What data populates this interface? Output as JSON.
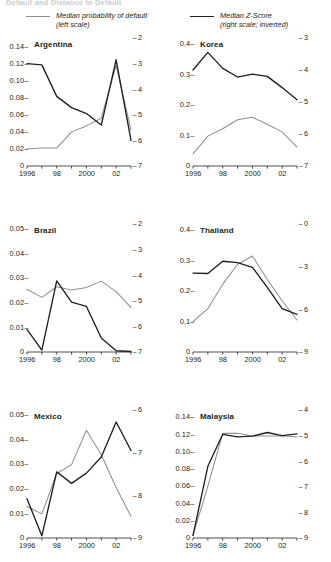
{
  "figure": {
    "title": "Default and Distance to Default",
    "legend": [
      {
        "id": "pd",
        "label_line1": "Median probability of default",
        "label_line2": "(left scale)",
        "color": "#8d9094",
        "style": "grey"
      },
      {
        "id": "z",
        "label_line1": "Median Z-Score",
        "label_line2": "(right scale; inverted)",
        "color": "#231f20",
        "style": "black"
      }
    ]
  },
  "chart_data": {
    "type": "line",
    "title": "Default and Distance to Default",
    "xlabel": "",
    "grid": false,
    "legend_position": "top",
    "x": [
      1996,
      1997,
      1998,
      1999,
      2000,
      2001,
      2002,
      2003
    ],
    "x_ticklabels": [
      "1996",
      "",
      "98",
      "",
      "2000",
      "",
      "02",
      ""
    ],
    "series_names": [
      "Median probability of default",
      "Median Z-Score"
    ],
    "panels": [
      {
        "name": "Argentina",
        "ylabel_left": "",
        "ylim_left": [
          0,
          0.15
        ],
        "yticks_left": [
          "0.14",
          "0.12",
          "0.10",
          "0.08",
          "0.06",
          "0.04",
          "0.02",
          "0"
        ],
        "ytick_values_left": [
          0.14,
          0.12,
          0.1,
          0.08,
          0.06,
          0.04,
          0.02,
          0
        ],
        "ylim_right": [
          2,
          7
        ],
        "yticks_right": [
          "2",
          "3",
          "4",
          "5",
          "6",
          "7"
        ],
        "ytick_values_right": [
          2,
          3,
          4,
          5,
          6,
          7
        ],
        "right_axis_inverted": true,
        "series": [
          {
            "name": "Median probability of default",
            "color": "#8d9094",
            "values": [
              0.02,
              0.021,
              0.021,
              0.04,
              0.047,
              0.056,
              0.118,
              0.042
            ]
          },
          {
            "name": "Median Z-Score",
            "color": "#231f20",
            "values": [
              3.0,
              3.05,
              4.28,
              4.72,
              4.95,
              5.4,
              2.85,
              6.0
            ]
          }
        ]
      },
      {
        "name": "Korea",
        "ylim_left": [
          0,
          0.42
        ],
        "yticks_left": [
          "0.4",
          "0.3",
          "0.2",
          "0.1",
          "0"
        ],
        "ytick_values_left": [
          0.4,
          0.3,
          0.2,
          0.1,
          0
        ],
        "ylim_right": [
          3,
          7
        ],
        "yticks_right": [
          "3",
          "4",
          "5",
          "6",
          "7"
        ],
        "ytick_values_right": [
          3,
          4,
          5,
          6,
          7
        ],
        "right_axis_inverted": true,
        "series": [
          {
            "name": "Median probability of default",
            "color": "#8d9094",
            "values": [
              0.04,
              0.098,
              0.122,
              0.152,
              0.16,
              0.137,
              0.112,
              0.062
            ]
          },
          {
            "name": "Median Z-Score",
            "color": "#231f20",
            "values": [
              4.0,
              3.45,
              3.95,
              4.22,
              4.13,
              4.2,
              4.55,
              4.93
            ]
          }
        ]
      },
      {
        "name": "Brazil",
        "ylim_left": [
          0,
          0.052
        ],
        "yticks_left": [
          "0.05",
          "0.04",
          "0.03",
          "0.02",
          "0.01",
          "0"
        ],
        "ytick_values_left": [
          0.05,
          0.04,
          0.03,
          0.02,
          0.01,
          0
        ],
        "ylim_right": [
          2,
          7
        ],
        "yticks_right": [
          "2",
          "3",
          "4",
          "5",
          "6",
          "7"
        ],
        "ytick_values_right": [
          2,
          3,
          4,
          5,
          6,
          7
        ],
        "right_axis_inverted": true,
        "series": [
          {
            "name": "Median probability of default",
            "color": "#8d9094",
            "values": [
              0.0255,
              0.0222,
              0.0265,
              0.0252,
              0.0262,
              0.0288,
              0.0245,
              0.018
            ]
          },
          {
            "name": "Median Z-Score",
            "color": "#231f20",
            "values": [
              6.12,
              6.93,
              4.22,
              5.05,
              5.22,
              6.45,
              6.95,
              6.98
            ]
          }
        ]
      },
      {
        "name": "Thailand",
        "ylim_left": [
          0,
          0.42
        ],
        "yticks_left": [
          "0.4",
          "0.3",
          "0.2",
          "0.1",
          "0"
        ],
        "ytick_values_left": [
          0.4,
          0.3,
          0.2,
          0.1,
          0
        ],
        "ylim_right": [
          0,
          9
        ],
        "yticks_right": [
          "0",
          "3",
          "6",
          "9"
        ],
        "ytick_values_right": [
          0,
          3,
          6,
          9
        ],
        "right_axis_inverted": true,
        "series": [
          {
            "name": "Median probability of default",
            "color": "#8d9094",
            "values": [
              0.1,
              0.142,
              0.222,
              0.288,
              0.315,
              0.238,
              0.168,
              0.105
            ]
          },
          {
            "name": "Median Z-Score",
            "color": "#231f20",
            "values": [
              3.45,
              3.48,
              2.62,
              2.72,
              3.05,
              4.45,
              5.95,
              6.35
            ]
          }
        ]
      },
      {
        "name": "Mexico",
        "ylim_left": [
          0,
          0.052
        ],
        "yticks_left": [
          "0.05",
          "0.04",
          "0.03",
          "0.02",
          "0.01",
          "0"
        ],
        "ytick_values_left": [
          0.05,
          0.04,
          0.03,
          0.02,
          0.01,
          0
        ],
        "ylim_right": [
          6,
          9
        ],
        "yticks_right": [
          "6",
          "7",
          "8",
          "9"
        ],
        "ytick_values_right": [
          6,
          7,
          8,
          9
        ],
        "right_axis_inverted": true,
        "series": [
          {
            "name": "Median probability of default",
            "color": "#8d9094",
            "values": [
              0.0128,
              0.0098,
              0.0262,
              0.0298,
              0.0438,
              0.0338,
              0.0205,
              0.0088
            ]
          },
          {
            "name": "Median Z-Score",
            "color": "#231f20",
            "values": [
              8.08,
              8.95,
              7.45,
              7.72,
              7.48,
              7.1,
              6.28,
              6.95
            ]
          }
        ]
      },
      {
        "name": "Malaysia",
        "ylim_left": [
          0,
          0.148
        ],
        "yticks_left": [
          "0.14",
          "0.12",
          "0.10",
          "0.08",
          "0.06",
          "0.04",
          "0.02",
          "0"
        ],
        "ytick_values_left": [
          0.14,
          0.12,
          0.1,
          0.08,
          0.06,
          0.04,
          0.02,
          0
        ],
        "ylim_right": [
          4,
          9
        ],
        "yticks_right": [
          "4",
          "5",
          "6",
          "7",
          "8",
          "9"
        ],
        "ytick_values_right": [
          4,
          5,
          6,
          7,
          8,
          9
        ],
        "right_axis_inverted": true,
        "series": [
          {
            "name": "Median probability of default",
            "color": "#8d9094",
            "values": [
              0.003,
              0.06,
              0.121,
              0.121,
              0.118,
              0.118,
              0.118,
              0.117
            ]
          },
          {
            "name": "Median Z-Score",
            "color": "#231f20",
            "values": [
              8.9,
              6.2,
              4.95,
              5.05,
              5.02,
              4.88,
              5.0,
              4.93
            ]
          }
        ]
      }
    ]
  }
}
